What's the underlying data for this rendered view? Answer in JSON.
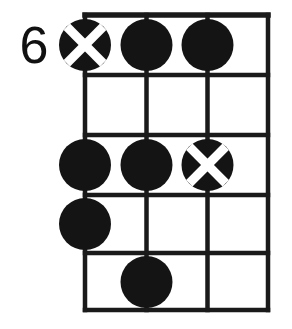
{
  "diagram": {
    "type": "guitar-chord-diagram",
    "fret_position_label": "6",
    "colors": {
      "ink": "#141414",
      "background": "#ffffff",
      "marker_cross": "#ffffff"
    },
    "geometry": {
      "strings_x": [
        85,
        146.5,
        207.5,
        268
      ],
      "frets_y": [
        15,
        75,
        135,
        195,
        253,
        310
      ],
      "dot_radius": 26,
      "string_count": 4,
      "fret_count": 5
    },
    "markers": [
      {
        "name": "marker-fret1-string1",
        "string": 1,
        "fret": 1,
        "cx": 85,
        "cy": 45,
        "style": "x"
      },
      {
        "name": "marker-fret1-string2",
        "string": 2,
        "fret": 1,
        "cx": 146.5,
        "cy": 45,
        "style": "filled"
      },
      {
        "name": "marker-fret1-string3",
        "string": 3,
        "fret": 1,
        "cx": 207.5,
        "cy": 45,
        "style": "filled"
      },
      {
        "name": "marker-fret3-string1",
        "string": 1,
        "fret": 3,
        "cx": 85,
        "cy": 165,
        "style": "filled"
      },
      {
        "name": "marker-fret3-string2",
        "string": 2,
        "fret": 3,
        "cx": 146.5,
        "cy": 165,
        "style": "filled"
      },
      {
        "name": "marker-fret3-string3",
        "string": 3,
        "fret": 3,
        "cx": 207.5,
        "cy": 165,
        "style": "x"
      },
      {
        "name": "marker-fret4-string1",
        "string": 1,
        "fret": 4,
        "cx": 85,
        "cy": 224,
        "style": "filled"
      },
      {
        "name": "marker-fret5-string2",
        "string": 2,
        "fret": 5,
        "cx": 146.5,
        "cy": 282,
        "style": "filled"
      }
    ]
  }
}
